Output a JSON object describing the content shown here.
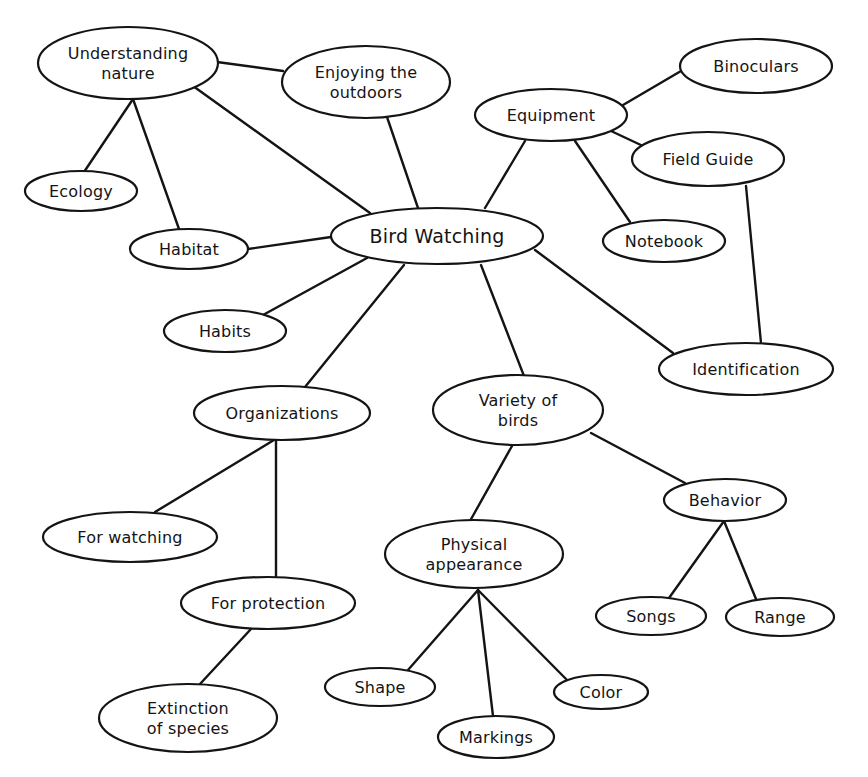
{
  "diagram": {
    "type": "mind-map",
    "title": "Bird Watching",
    "colors": {
      "stroke": "#141414",
      "background": "#ffffff",
      "node_fill": "#ffffff"
    },
    "nodes": [
      {
        "id": "bird_watching",
        "lines": [
          "Bird Watching"
        ],
        "cx": 437,
        "cy": 236,
        "rx": 106,
        "ry": 28,
        "center": true
      },
      {
        "id": "understanding_nature",
        "lines": [
          "Understanding",
          "nature"
        ],
        "cx": 128,
        "cy": 63,
        "rx": 90,
        "ry": 36
      },
      {
        "id": "enjoying_outdoors",
        "lines": [
          "Enjoying the",
          "outdoors"
        ],
        "cx": 366,
        "cy": 82,
        "rx": 84,
        "ry": 36
      },
      {
        "id": "equipment",
        "lines": [
          "Equipment"
        ],
        "cx": 551,
        "cy": 115,
        "rx": 76,
        "ry": 26
      },
      {
        "id": "binoculars",
        "lines": [
          "Binoculars"
        ],
        "cx": 756,
        "cy": 66,
        "rx": 76,
        "ry": 27
      },
      {
        "id": "field_guide",
        "lines": [
          "Field Guide"
        ],
        "cx": 708,
        "cy": 159,
        "rx": 76,
        "ry": 27
      },
      {
        "id": "notebook",
        "lines": [
          "Notebook"
        ],
        "cx": 664,
        "cy": 241,
        "rx": 61,
        "ry": 21
      },
      {
        "id": "ecology",
        "lines": [
          "Ecology"
        ],
        "cx": 81,
        "cy": 191,
        "rx": 56,
        "ry": 20
      },
      {
        "id": "habitat",
        "lines": [
          "Habitat"
        ],
        "cx": 189,
        "cy": 249,
        "rx": 59,
        "ry": 20
      },
      {
        "id": "habits",
        "lines": [
          "Habits"
        ],
        "cx": 225,
        "cy": 331,
        "rx": 61,
        "ry": 21
      },
      {
        "id": "identification",
        "lines": [
          "Identification"
        ],
        "cx": 746,
        "cy": 369,
        "rx": 87,
        "ry": 26
      },
      {
        "id": "organizations",
        "lines": [
          "Organizations"
        ],
        "cx": 282,
        "cy": 413,
        "rx": 88,
        "ry": 27
      },
      {
        "id": "variety_of_birds",
        "lines": [
          "Variety of",
          "birds"
        ],
        "cx": 518,
        "cy": 410,
        "rx": 85,
        "ry": 35
      },
      {
        "id": "behavior",
        "lines": [
          "Behavior"
        ],
        "cx": 725,
        "cy": 500,
        "rx": 61,
        "ry": 21
      },
      {
        "id": "for_watching",
        "lines": [
          "For watching"
        ],
        "cx": 130,
        "cy": 537,
        "rx": 87,
        "ry": 25
      },
      {
        "id": "physical_appearance",
        "lines": [
          "Physical",
          "appearance"
        ],
        "cx": 474,
        "cy": 554,
        "rx": 89,
        "ry": 34
      },
      {
        "id": "for_protection",
        "lines": [
          "For protection"
        ],
        "cx": 268,
        "cy": 603,
        "rx": 87,
        "ry": 26
      },
      {
        "id": "songs",
        "lines": [
          "Songs"
        ],
        "cx": 651,
        "cy": 616,
        "rx": 55,
        "ry": 19
      },
      {
        "id": "range",
        "lines": [
          "Range"
        ],
        "cx": 780,
        "cy": 617,
        "rx": 54,
        "ry": 19
      },
      {
        "id": "shape",
        "lines": [
          "Shape"
        ],
        "cx": 380,
        "cy": 687,
        "rx": 55,
        "ry": 19
      },
      {
        "id": "color",
        "lines": [
          "Color"
        ],
        "cx": 601,
        "cy": 692,
        "rx": 47,
        "ry": 17
      },
      {
        "id": "extinction_of_species",
        "lines": [
          "Extinction",
          "of species"
        ],
        "cx": 188,
        "cy": 718,
        "rx": 89,
        "ry": 34
      },
      {
        "id": "markings",
        "lines": [
          "Markings"
        ],
        "cx": 496,
        "cy": 737,
        "rx": 58,
        "ry": 21
      }
    ],
    "edges": [
      {
        "from": "understanding_nature",
        "to": "enjoying_outdoors",
        "x1": 217,
        "y1": 62,
        "x2": 283,
        "y2": 71
      },
      {
        "from": "understanding_nature",
        "to": "bird_watching",
        "x1": 193,
        "y1": 86,
        "x2": 370,
        "y2": 213
      },
      {
        "from": "understanding_nature",
        "to": "ecology",
        "x1": 133,
        "y1": 99,
        "x2": 84,
        "y2": 172
      },
      {
        "from": "understanding_nature",
        "to": "habitat",
        "x1": 133,
        "y1": 99,
        "x2": 179,
        "y2": 229
      },
      {
        "from": "enjoying_outdoors",
        "to": "bird_watching",
        "x1": 387,
        "y1": 117,
        "x2": 418,
        "y2": 208
      },
      {
        "from": "bird_watching",
        "to": "equipment",
        "x1": 485,
        "y1": 208,
        "x2": 525,
        "y2": 141
      },
      {
        "from": "equipment",
        "to": "binoculars",
        "x1": 623,
        "y1": 105,
        "x2": 681,
        "y2": 71
      },
      {
        "from": "equipment",
        "to": "field_guide",
        "x1": 611,
        "y1": 131,
        "x2": 643,
        "y2": 146
      },
      {
        "from": "equipment",
        "to": "notebook",
        "x1": 575,
        "y1": 141,
        "x2": 630,
        "y2": 222
      },
      {
        "from": "field_guide",
        "to": "identification",
        "x1": 746,
        "y1": 186,
        "x2": 761,
        "y2": 343
      },
      {
        "from": "bird_watching",
        "to": "habitat",
        "x1": 331,
        "y1": 237,
        "x2": 248,
        "y2": 249
      },
      {
        "from": "bird_watching",
        "to": "habits",
        "x1": 367,
        "y1": 258,
        "x2": 263,
        "y2": 315
      },
      {
        "from": "bird_watching",
        "to": "organizations",
        "x1": 404,
        "y1": 265,
        "x2": 305,
        "y2": 387
      },
      {
        "from": "bird_watching",
        "to": "variety_of_birds",
        "x1": 481,
        "y1": 265,
        "x2": 524,
        "y2": 376
      },
      {
        "from": "bird_watching",
        "to": "identification",
        "x1": 535,
        "y1": 250,
        "x2": 673,
        "y2": 353
      },
      {
        "from": "organizations",
        "to": "for_watching",
        "x1": 274,
        "y1": 440,
        "x2": 155,
        "y2": 512
      },
      {
        "from": "organizations",
        "to": "for_protection",
        "x1": 276,
        "y1": 440,
        "x2": 276,
        "y2": 578
      },
      {
        "from": "for_protection",
        "to": "extinction_of_species",
        "x1": 251,
        "y1": 629,
        "x2": 200,
        "y2": 684
      },
      {
        "from": "variety_of_birds",
        "to": "physical_appearance",
        "x1": 512,
        "y1": 446,
        "x2": 470,
        "y2": 521
      },
      {
        "from": "variety_of_birds",
        "to": "behavior",
        "x1": 591,
        "y1": 433,
        "x2": 685,
        "y2": 483
      },
      {
        "from": "behavior",
        "to": "songs",
        "x1": 724,
        "y1": 521,
        "x2": 669,
        "y2": 598
      },
      {
        "from": "behavior",
        "to": "range",
        "x1": 724,
        "y1": 521,
        "x2": 756,
        "y2": 599
      },
      {
        "from": "physical_appearance",
        "to": "shape",
        "x1": 478,
        "y1": 590,
        "x2": 408,
        "y2": 670
      },
      {
        "from": "physical_appearance",
        "to": "markings",
        "x1": 478,
        "y1": 590,
        "x2": 493,
        "y2": 716
      },
      {
        "from": "physical_appearance",
        "to": "color",
        "x1": 478,
        "y1": 590,
        "x2": 568,
        "y2": 681
      }
    ]
  }
}
